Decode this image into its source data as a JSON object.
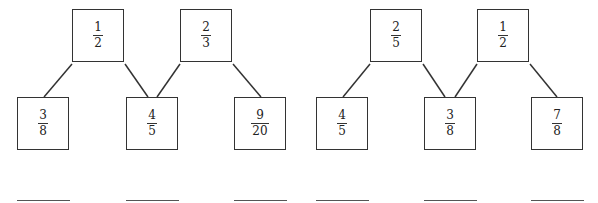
{
  "puzzles": [
    {
      "top": [
        {
          "num": "1",
          "den": "2"
        },
        {
          "num": "2",
          "den": "3"
        }
      ],
      "bottom": [
        {
          "num": "3",
          "den": "8"
        },
        {
          "num": "4",
          "den": "5"
        },
        {
          "num": "9",
          "den": "20"
        }
      ],
      "answers": [
        "",
        "",
        ""
      ]
    },
    {
      "top": [
        {
          "num": "2",
          "den": "5"
        },
        {
          "num": "1",
          "den": "2"
        }
      ],
      "bottom": [
        {
          "num": "4",
          "den": "5"
        },
        {
          "num": "3",
          "den": "8"
        },
        {
          "num": "7",
          "den": "8"
        }
      ],
      "answers": [
        "",
        "",
        ""
      ]
    }
  ]
}
